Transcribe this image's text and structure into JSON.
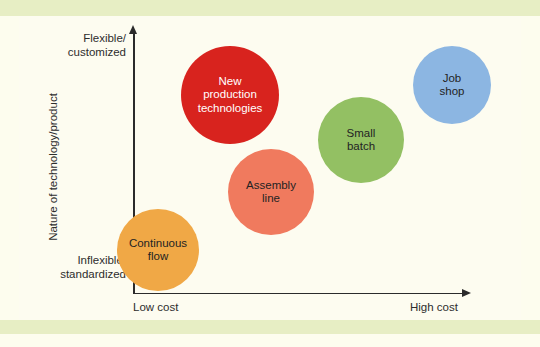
{
  "figure": {
    "width": 540,
    "height": 347,
    "background_color": "#fdfdee",
    "band_color": "#e7eec4",
    "canvas_color": "#fdfcf0",
    "axis_color": "#2b2b2b"
  },
  "axes": {
    "y_top_label": "Flexible/\ncustomized",
    "y_bottom_label": "Inflexible/\nstandardized",
    "y_title": "Nature of technology/product",
    "x_left_label": "Low cost",
    "x_right_label": "High cost"
  },
  "chart_data": {
    "type": "scatter",
    "title": "",
    "xlabel": "Cost",
    "ylabel": "Nature of technology/product",
    "xlim": [
      0,
      100
    ],
    "ylim": [
      0,
      100
    ],
    "grid": false,
    "legend_position": "none",
    "x_tick_labels": [
      "Low cost",
      "High cost"
    ],
    "y_tick_labels": [
      "Inflexible/standardized",
      "Flexible/customized"
    ],
    "points": [
      {
        "label": "Continuous\nflow",
        "name": "Continuous flow",
        "color": "#F0A846",
        "text_color": "dark",
        "cx": 158,
        "cy": 250,
        "r": 41,
        "x_value": 12,
        "y_value": 18
      },
      {
        "label": "Assembly\nline",
        "name": "Assembly line",
        "color": "#F07A5E",
        "text_color": "dark",
        "cx": 271,
        "cy": 192,
        "r": 43,
        "x_value": 42,
        "y_value": 40
      },
      {
        "label": "New\nproduction\ntechnologies",
        "name": "New production technologies",
        "color": "#D8231E",
        "text_color": "light",
        "cx": 230,
        "cy": 95,
        "r": 49,
        "x_value": 30,
        "y_value": 76
      },
      {
        "label": "Small\nbatch",
        "name": "Small batch",
        "color": "#93C063",
        "text_color": "dark",
        "cx": 361,
        "cy": 140,
        "r": 43,
        "x_value": 65,
        "y_value": 62
      },
      {
        "label": "Job\nshop",
        "name": "Job shop",
        "color": "#8CB6E2",
        "text_color": "dark",
        "cx": 452,
        "cy": 85,
        "r": 39,
        "x_value": 88,
        "y_value": 81
      }
    ]
  }
}
